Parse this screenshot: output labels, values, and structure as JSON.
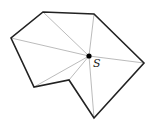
{
  "diagram": {
    "point": {
      "label": "S",
      "x": 89,
      "y": 56,
      "label_x": 93,
      "label_y": 58
    },
    "polygon": [
      {
        "x": 43,
        "y": 12
      },
      {
        "x": 94,
        "y": 14
      },
      {
        "x": 144,
        "y": 63
      },
      {
        "x": 94,
        "y": 118
      },
      {
        "x": 69,
        "y": 80
      },
      {
        "x": 34,
        "y": 87
      },
      {
        "x": 11,
        "y": 38
      }
    ],
    "colors": {
      "edge": "#222222",
      "fan": "#aaaaaa",
      "point": "#000000"
    }
  }
}
